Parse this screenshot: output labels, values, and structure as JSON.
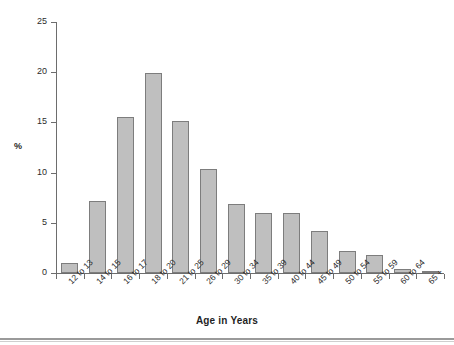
{
  "chart_data": {
    "type": "bar",
    "title": "",
    "subtitle": "",
    "xlabel": "Age in Years",
    "ylabel": "%",
    "categories": [
      "12 to 13",
      "14 to 15",
      "16 to 17",
      "18 to 20",
      "21 to 25",
      "26 to 29",
      "30 to 34",
      "35 to 39",
      "40 to 44",
      "45 to 49",
      "50 to 54",
      "55 to 59",
      "60 to 64",
      "65 +"
    ],
    "values": [
      1.0,
      7.2,
      15.5,
      19.9,
      15.1,
      10.4,
      6.9,
      6.0,
      6.0,
      4.2,
      2.2,
      1.8,
      0.4,
      0.15
    ],
    "ylim": [
      0,
      25
    ],
    "yticks": [
      0,
      5,
      10,
      15,
      20,
      25
    ],
    "ytick_labels": [
      "0",
      "5",
      "10",
      "15",
      "20",
      "25"
    ],
    "grid": false,
    "legend": null,
    "bar_color": "#bfbfbf",
    "bar_edge_color": "#7d7d7d",
    "axis_color": "#6d6d6d",
    "text_color": "#2b2b2b"
  }
}
